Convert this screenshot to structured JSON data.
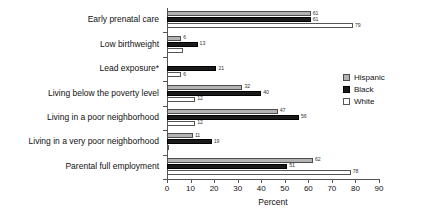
{
  "chart_data": {
    "type": "bar",
    "orientation": "horizontal",
    "title": "",
    "xlabel": "Percent",
    "ylabel": "",
    "xlim": [
      0,
      90
    ],
    "xticks": [
      0,
      10,
      20,
      30,
      40,
      50,
      60,
      70,
      80,
      90
    ],
    "grid": false,
    "legend_position": "right",
    "categories": [
      "Early prenatal care",
      "Low birthweight",
      "Lead exposure*",
      "Living below the poverty level",
      "Living in a poor neighborhood",
      "Living in a very poor neighborhood",
      "Parental full employment"
    ],
    "series": [
      {
        "name": "Hispanic",
        "color": "#b3b3b3",
        "values": [
          61,
          6,
          null,
          32,
          47,
          11,
          62
        ],
        "labels": [
          "61",
          "6",
          "",
          "32",
          "47",
          "11",
          "62"
        ]
      },
      {
        "name": "Black",
        "color": "#1a1a1a",
        "values": [
          61,
          13,
          21,
          40,
          56,
          19,
          51
        ],
        "labels": [
          "61",
          "13",
          "21",
          "40",
          "56",
          "19",
          "51"
        ]
      },
      {
        "name": "White",
        "color": "#ffffff",
        "values": [
          79,
          7,
          6,
          12,
          12,
          1,
          78
        ],
        "labels": [
          "79",
          "",
          "6",
          "12",
          "12",
          "",
          "78"
        ]
      }
    ]
  },
  "legend": {
    "items": [
      {
        "label": "Hispanic",
        "swatch": "hispanic"
      },
      {
        "label": "Black",
        "swatch": "black"
      },
      {
        "label": "White",
        "swatch": "white"
      }
    ]
  },
  "axis": {
    "x_title": "Percent",
    "tick_labels": [
      "0",
      "10",
      "20",
      "30",
      "40",
      "50",
      "60",
      "70",
      "80",
      "90"
    ]
  }
}
